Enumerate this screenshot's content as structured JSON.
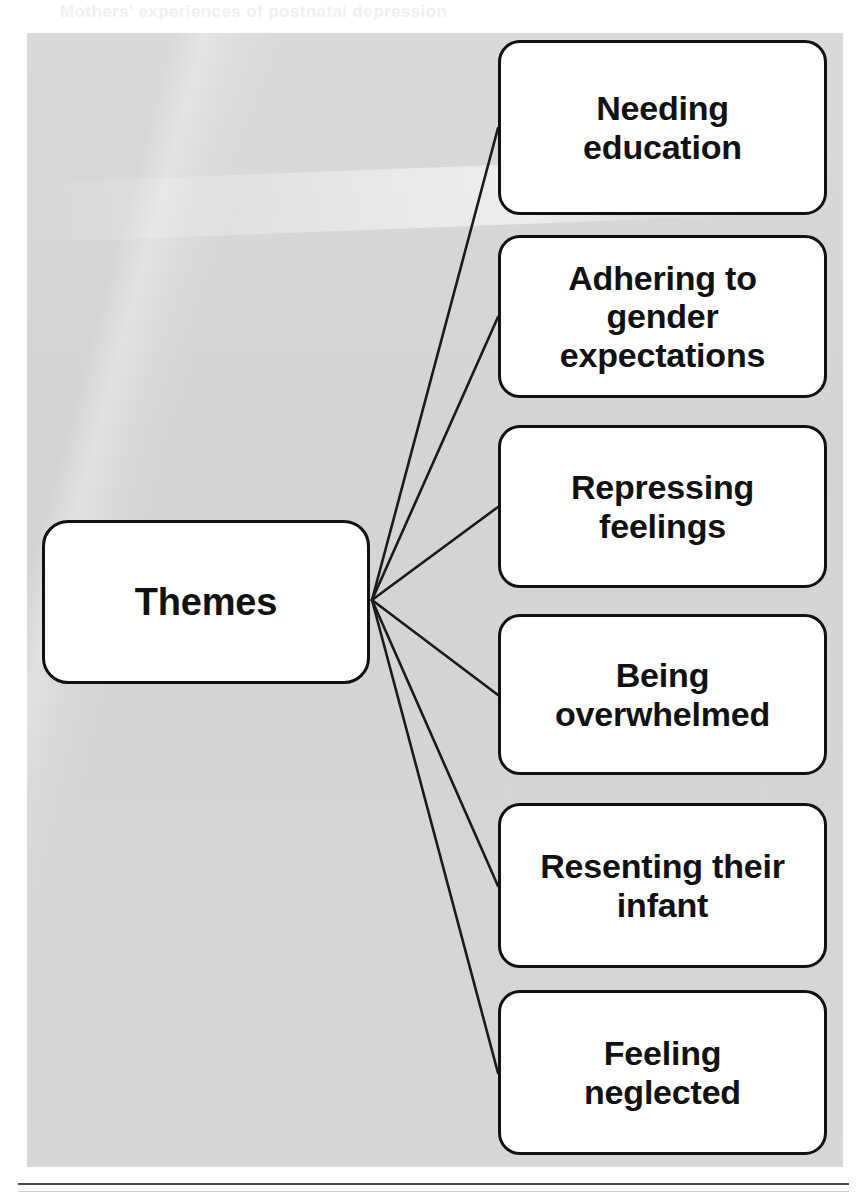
{
  "page": {
    "showthrough_text": "Mothers' experiences of postnatal depression",
    "footer_rule": "horizontal-rule"
  },
  "diagram": {
    "type": "radial-tree",
    "root": {
      "label": "Themes"
    },
    "branches": [
      {
        "label": "Needing\neducation"
      },
      {
        "label": "Adhering to\ngender\nexpectations"
      },
      {
        "label": "Repressing\nfeelings"
      },
      {
        "label": "Being\noverwhelmed"
      },
      {
        "label": "Resenting their\ninfant"
      },
      {
        "label": "Feeling\nneglected"
      }
    ],
    "colors": {
      "panel_background": "#d5d5d5",
      "node_fill": "#ffffff",
      "node_border": "#111111",
      "connector": "#1a1a1a",
      "text": "#111111"
    },
    "geometry": {
      "fan_origin_x": 372,
      "fan_origin_y": 600,
      "branch_anchor_x": 498
    }
  }
}
